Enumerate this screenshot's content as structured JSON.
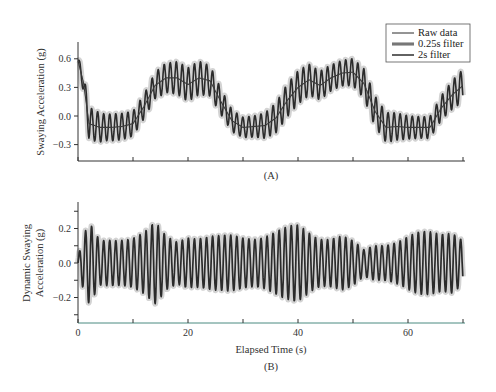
{
  "chart_data": [
    {
      "panel": "A",
      "type": "line",
      "caption": "(A)",
      "xlabel": "",
      "ylabel": "Swaying Acceleration (g)",
      "xlim": [
        0,
        70
      ],
      "ylim": [
        -0.42,
        0.72
      ],
      "xticks": [
        0,
        10,
        20,
        30,
        40,
        50,
        60,
        70
      ],
      "xtick_labels": [],
      "yticks": [
        -0.3,
        0.0,
        0.3,
        0.6
      ],
      "ytick_labels": [
        "-0.3",
        "0.0",
        "0.3",
        "0.6"
      ],
      "grid": false,
      "legend_position": "upper right",
      "oscillation_period_s": 1.1,
      "series": [
        {
          "name": "Raw data",
          "description": "fast oscillation around 2s-filter trend",
          "amplitude_profile": {
            "t": [
              0,
              2,
              5,
              10,
              15,
              20,
              25,
              28,
              32,
              40,
              45,
              50,
              55,
              60,
              65,
              70
            ],
            "amp": [
              0.05,
              0.18,
              0.14,
              0.17,
              0.2,
              0.18,
              0.17,
              0.16,
              0.15,
              0.18,
              0.2,
              0.18,
              0.16,
              0.15,
              0.17,
              0.18
            ]
          }
        },
        {
          "name": "0.25s filter",
          "description": "light gray wide band around raw data"
        },
        {
          "name": "2s filter",
          "description": "smooth low-frequency trend",
          "t": [
            0,
            1,
            2,
            4,
            6,
            8,
            10,
            12,
            14,
            16,
            18,
            20,
            22,
            24,
            26,
            28,
            30,
            32,
            34,
            36,
            38,
            40,
            42,
            44,
            46,
            48,
            50,
            52,
            54,
            56,
            58,
            60,
            62,
            64,
            66,
            68,
            70
          ],
          "values": [
            0.58,
            0.35,
            -0.08,
            -0.12,
            -0.12,
            -0.11,
            -0.08,
            0.1,
            0.32,
            0.4,
            0.4,
            0.33,
            0.4,
            0.37,
            0.15,
            -0.05,
            -0.12,
            -0.11,
            -0.1,
            -0.02,
            0.16,
            0.3,
            0.38,
            0.32,
            0.4,
            0.45,
            0.46,
            0.34,
            0.05,
            -0.12,
            -0.11,
            -0.12,
            -0.12,
            -0.12,
            0.08,
            0.22,
            0.32
          ]
        }
      ]
    },
    {
      "panel": "B",
      "type": "line",
      "caption": "(B)",
      "xlabel": "Elapsed Time (s)",
      "ylabel": "Dynamic Swaying Acceleration (g)",
      "ylabel_lines": [
        "Dynamic Swaying",
        "Acceleration (g)"
      ],
      "xlim": [
        0,
        70
      ],
      "ylim": [
        -0.35,
        0.35
      ],
      "xticks": [
        0,
        10,
        20,
        30,
        40,
        50,
        60,
        70
      ],
      "xtick_labels": [
        "0",
        "",
        "20",
        "",
        "40",
        "",
        "60",
        ""
      ],
      "yticks": [
        -0.3,
        -0.2,
        -0.1,
        0.0,
        0.1,
        0.2,
        0.3
      ],
      "ytick_labels": [
        "",
        "-0.2",
        "",
        "0.0",
        "",
        "0.2",
        ""
      ],
      "grid": false,
      "oscillation_period_s": 1.1,
      "series": [
        {
          "name": "Dynamic swaying acceleration (raw minus 2s trend)",
          "description": "zero-mean oscillation, amplitude roughly 0.12-0.25 g",
          "amplitude_profile": {
            "t": [
              0,
              1,
              2,
              4,
              8,
              12,
              14,
              16,
              18,
              20,
              22,
              26,
              30,
              34,
              38,
              40,
              44,
              48,
              50,
              52,
              54,
              58,
              62,
              66,
              68,
              70
            ],
            "amp": [
              0.04,
              0.17,
              0.24,
              0.13,
              0.17,
              0.2,
              0.24,
              0.16,
              0.14,
              0.19,
              0.18,
              0.16,
              0.17,
              0.19,
              0.21,
              0.23,
              0.18,
              0.17,
              0.13,
              0.08,
              0.12,
              0.15,
              0.18,
              0.2,
              0.23,
              0.16
            ]
          }
        }
      ]
    }
  ],
  "legend": {
    "items": [
      {
        "label": "Raw data",
        "style": "thin-dark"
      },
      {
        "label": "0.25s filter",
        "style": "thick-gray"
      },
      {
        "label": "2s filter",
        "style": "medium-dark"
      }
    ]
  },
  "colors": {
    "raw": "#2b2b2b",
    "filter_025": "#b8b8b8",
    "filter_2s": "#3a3a3a",
    "axis": "#333333",
    "bottom_axis_tint": "#5aa89a"
  }
}
